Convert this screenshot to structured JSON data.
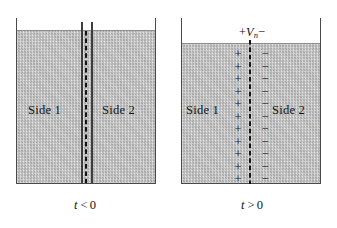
{
  "figure": {
    "type": "physics-diagram"
  },
  "panels": [
    {
      "id": "before",
      "caption": {
        "variable": "t",
        "relation": "<",
        "value": "0",
        "full": "t < 0"
      },
      "regions": [
        {
          "label": "Side 1"
        },
        {
          "label": "Side 2"
        }
      ],
      "divider": {
        "style": "dashed-between-two-solid-lines",
        "solid_line_count": 2,
        "dashed_line_count": 1
      },
      "charges": {
        "positive_count": 0,
        "negative_count": 0
      },
      "voltage_label": null
    },
    {
      "id": "after",
      "caption": {
        "variable": "t",
        "relation": ">",
        "value": "0",
        "full": "t > 0"
      },
      "regions": [
        {
          "label": "Side 1"
        },
        {
          "label": "Side 2"
        }
      ],
      "divider": {
        "style": "dashed",
        "solid_line_count": 0,
        "dashed_line_count": 1
      },
      "charges": {
        "positive_count": 11,
        "negative_count": 11,
        "positive_symbol": "+",
        "negative_symbol": "−",
        "positive_side": "Side 1",
        "negative_side": "Side 2"
      },
      "voltage_label": {
        "leading_sign": "+",
        "variable": "V",
        "subscript": "n",
        "trailing_sign": "−",
        "full": "+Vₙ−"
      }
    }
  ],
  "colors": {
    "fluid_fill": "#c9c9c9",
    "vessel_stroke": "#4a4a4a",
    "divider_solid": "#3d3d3d",
    "divider_dashed": "#131313",
    "text": "#151515",
    "background": "#ffffff"
  }
}
